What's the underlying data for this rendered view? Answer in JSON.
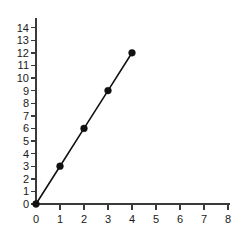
{
  "chart_data": {
    "type": "line",
    "title": "",
    "subtitle": "",
    "xlabel": "",
    "ylabel": "",
    "xlim": [
      0,
      8
    ],
    "ylim": [
      0,
      14
    ],
    "grid": false,
    "legend": false,
    "legend_position": "none",
    "marker": "filled-circle",
    "line_color": "#111111",
    "marker_color": "#111111",
    "axis_color": "#3a3a3a",
    "background_color": "#ffffff",
    "x": [
      0,
      1,
      2,
      3,
      4
    ],
    "series": [
      {
        "name": "",
        "values": [
          0,
          3,
          6,
          9,
          12
        ]
      }
    ],
    "points": [
      {
        "x": 0,
        "y": 0
      },
      {
        "x": 1,
        "y": 3
      },
      {
        "x": 2,
        "y": 6
      },
      {
        "x": 3,
        "y": 9
      },
      {
        "x": 4,
        "y": 12
      }
    ],
    "xticks": [
      0,
      1,
      2,
      3,
      4,
      5,
      6,
      7,
      8
    ],
    "xtick_labels": [
      "0",
      "1",
      "2",
      "3",
      "4",
      "5",
      "6",
      "7",
      "8"
    ],
    "yticks": [
      0,
      1,
      2,
      3,
      4,
      5,
      6,
      7,
      8,
      9,
      10,
      11,
      12,
      13,
      14
    ],
    "ytick_labels": [
      "0",
      "1",
      "2",
      "3",
      "4",
      "5",
      "6",
      "7",
      "8",
      "9",
      "10",
      "11",
      "12",
      "13",
      "14"
    ]
  }
}
